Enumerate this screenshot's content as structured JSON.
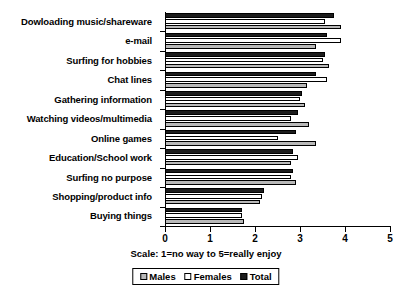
{
  "chart_data": {
    "type": "bar",
    "orientation": "horizontal",
    "title": "",
    "xlabel": "Scale:  1=no way to 5=really enjoy",
    "ylabel": "",
    "xlim": [
      0,
      5
    ],
    "xticks": [
      "0",
      "1",
      "2",
      "3",
      "4",
      "5"
    ],
    "grid": false,
    "legend_position": "bottom",
    "categories": [
      "Dowloading music/shareware",
      "e-mail",
      "Surfing for hobbies",
      "Chat lines",
      "Gathering information",
      "Watching videos/multimedia",
      "Online games",
      "Education/School work",
      "Surfing no purpose",
      "Shopping/product info",
      "Buying things"
    ],
    "series": [
      {
        "name": "Total",
        "color": "#1c1c1c",
        "values": [
          3.75,
          3.6,
          3.55,
          3.35,
          3.05,
          2.95,
          2.9,
          2.85,
          2.85,
          2.2,
          1.7
        ]
      },
      {
        "name": "Females",
        "color": "#ffffff",
        "values": [
          3.55,
          3.9,
          3.5,
          3.6,
          3.0,
          2.8,
          2.5,
          2.95,
          2.8,
          2.15,
          1.7
        ]
      },
      {
        "name": "Males",
        "color": "#b9b9b9",
        "values": [
          3.9,
          3.35,
          3.65,
          3.15,
          3.1,
          3.2,
          3.35,
          2.8,
          2.9,
          2.1,
          1.75
        ]
      }
    ]
  },
  "legend": {
    "items": [
      {
        "label": "Males",
        "swatch": "males-swatch"
      },
      {
        "label": "Females",
        "swatch": "females-swatch"
      },
      {
        "label": "Total",
        "swatch": "total-swatch"
      }
    ]
  }
}
